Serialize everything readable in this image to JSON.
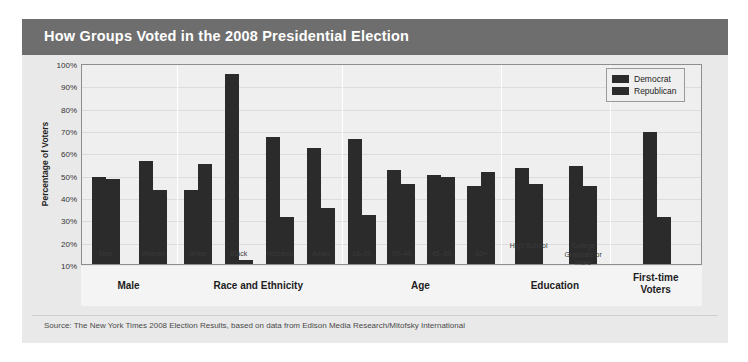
{
  "header": {
    "title": "How Groups Voted in the 2008 Presidential Election"
  },
  "footer": {
    "source": "Source: The New York Times 2008 Election Results, based on data from Edison Media Research/Mitofsky International"
  },
  "legend": {
    "position": "top-right",
    "entries": [
      {
        "label": "Democrat",
        "color": "#2b2b2b",
        "swatch_name": "democrat-swatch"
      },
      {
        "label": "Republican",
        "color": "#2b2b2b",
        "swatch_name": "republican-swatch"
      }
    ]
  },
  "axes": {
    "ylabel": "Percentage of Voters",
    "yticks": [
      "100%",
      "90%",
      "80%",
      "70%",
      "60%",
      "50%",
      "40%",
      "30%",
      "20%",
      "10%"
    ],
    "ymin": 10,
    "ymax": 100
  },
  "groups": [
    {
      "name": "Male",
      "categories": [
        "Men",
        "Women"
      ]
    },
    {
      "name": "Race and Ethnicity",
      "categories": [
        "White",
        "Black",
        "Hispanic",
        "Asian"
      ]
    },
    {
      "name": "Age",
      "categories": [
        "18–29",
        "30–44",
        "45–59",
        "60+"
      ]
    },
    {
      "name": "Education",
      "categories": [
        "High School",
        "College Graduate or more"
      ]
    },
    {
      "name": "First-time Voters",
      "categories": [
        ""
      ]
    }
  ],
  "chart_data": {
    "type": "bar",
    "title": "How Groups Voted in the 2008 Presidential Election",
    "xlabel": "",
    "ylabel": "Percentage of Voters",
    "ylim": [
      10,
      100
    ],
    "ytick_labels": [
      "10%",
      "20%",
      "30%",
      "40%",
      "50%",
      "60%",
      "70%",
      "80%",
      "90%",
      "100%"
    ],
    "grid": true,
    "legend_position": "top-right",
    "panels": [
      {
        "group": "Male",
        "categories": [
          "Men",
          "Women"
        ],
        "series": [
          {
            "name": "Democrat",
            "values": [
              49,
              56
            ]
          },
          {
            "name": "Republican",
            "values": [
              48,
              43
            ]
          }
        ]
      },
      {
        "group": "Race and Ethnicity",
        "categories": [
          "White",
          "Black",
          "Hispanic",
          "Asian"
        ],
        "series": [
          {
            "name": "Democrat",
            "values": [
              43,
              95,
              67,
              62
            ]
          },
          {
            "name": "Republican",
            "values": [
              55,
              12,
              31,
              35
            ]
          }
        ]
      },
      {
        "group": "Age",
        "categories": [
          "18–29",
          "30–44",
          "45–59",
          "60+"
        ],
        "series": [
          {
            "name": "Democrat",
            "values": [
              66,
              52,
              50,
              45
            ]
          },
          {
            "name": "Republican",
            "values": [
              32,
              46,
              49,
              51
            ]
          }
        ]
      },
      {
        "group": "Education",
        "categories": [
          "High School",
          "College Graduate or more"
        ],
        "series": [
          {
            "name": "Democrat",
            "values": [
              53,
              54
            ]
          },
          {
            "name": "Republican",
            "values": [
              46,
              45
            ]
          }
        ]
      },
      {
        "group": "First-time Voters",
        "categories": [
          "First-time Voters"
        ],
        "series": [
          {
            "name": "Democrat",
            "values": [
              69
            ]
          },
          {
            "name": "Republican",
            "values": [
              31
            ]
          }
        ]
      }
    ]
  },
  "colors": {
    "header_bar": "#6e6e6e",
    "card_background": "#e9e9e9",
    "plot_background": "#efefef",
    "bar": "#2b2b2b",
    "gridline": "#dcdcdc"
  }
}
